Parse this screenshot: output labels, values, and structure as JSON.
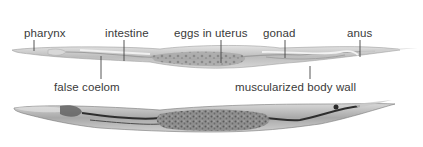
{
  "figure": {
    "labels_top": [
      {
        "id": "pharynx",
        "text": "pharynx",
        "x": 24,
        "y": 27,
        "line_x": 34,
        "line_y1": 41,
        "line_y2": 51
      },
      {
        "id": "intestine",
        "text": "intestine",
        "x": 105,
        "y": 27,
        "line_x": 124,
        "line_y1": 41,
        "line_y2": 61
      },
      {
        "id": "eggs-in-uterus",
        "text": "eggs in uterus",
        "x": 174,
        "y": 27,
        "line_x": 221,
        "line_y1": 41,
        "line_y2": 63
      },
      {
        "id": "gonad",
        "text": "gonad",
        "x": 263,
        "y": 27,
        "line_x": 285,
        "line_y1": 41,
        "line_y2": 58
      },
      {
        "id": "anus",
        "text": "anus",
        "x": 347,
        "y": 27,
        "line_x": 360,
        "line_y1": 41,
        "line_y2": 57
      }
    ],
    "labels_bottom": [
      {
        "id": "false-coelom",
        "text": "false coelom",
        "x": 54,
        "y": 81,
        "line_x": 101,
        "line_y1": 56,
        "line_y2": 79
      },
      {
        "id": "muscularized-body-wall",
        "text": "muscularized body wall",
        "x": 235,
        "y": 81,
        "line_x": 310,
        "line_y1": 66,
        "line_y2": 79
      }
    ],
    "colors": {
      "label_text": "#3a3a3a",
      "leader_line": "#444444",
      "worm1_body": "#c9c9c9",
      "worm1_gut": "#b5b5b5",
      "worm2_body": "#bdbdbd",
      "worm2_dark": "#3a3a3a"
    }
  }
}
